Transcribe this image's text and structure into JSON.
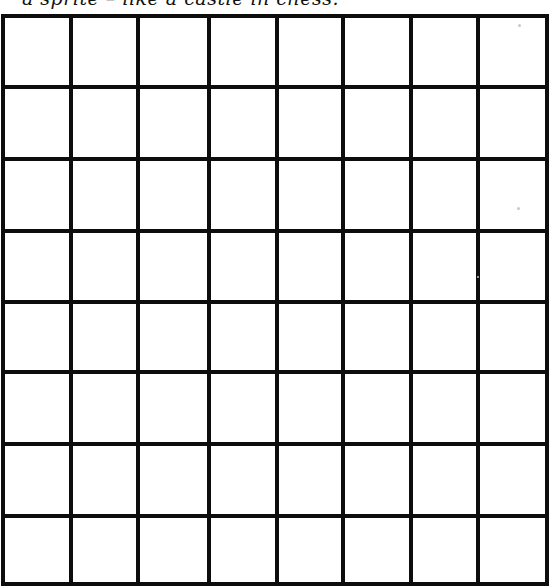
{
  "caption": {
    "text": "a sprite – like a castle in chess."
  },
  "grid": {
    "rows": 8,
    "columns": 8,
    "line_color": "#0d0d0d",
    "line_width": 4,
    "x_lines": [
      3,
      71,
      138,
      209,
      277,
      343,
      411,
      478,
      547
    ],
    "y_lines": [
      16,
      87,
      159,
      231,
      302,
      372,
      444,
      516,
      584
    ],
    "cells_filled": []
  }
}
